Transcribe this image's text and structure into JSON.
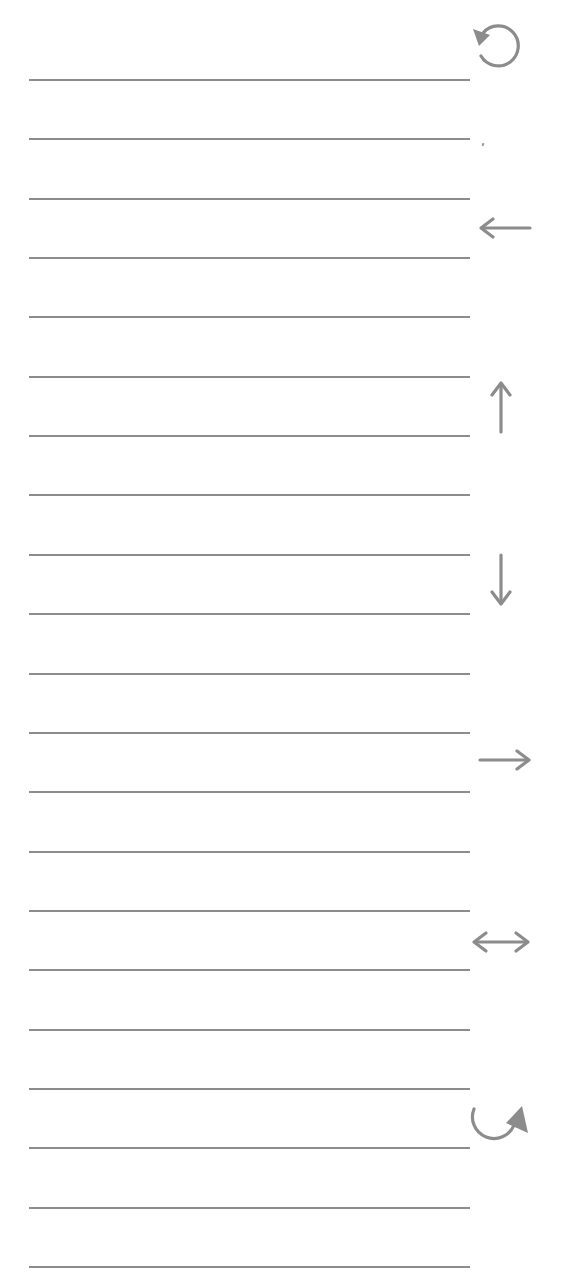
{
  "sheet": {
    "background": "#ffffff",
    "line_color": "#8c8c8c",
    "icon_color": "#8c8c8c",
    "line_count": 21,
    "line_left": 29,
    "line_right": 470,
    "line_first_y": 79,
    "line_spacing": 59.35
  },
  "icons": [
    {
      "name": "rotate-counterclockwise-icon",
      "symbol": "↺",
      "x": 470,
      "y": 22,
      "w": 56,
      "h": 52
    },
    {
      "name": "arrow-left-icon",
      "symbol": "←",
      "x": 478,
      "y": 216,
      "w": 54,
      "h": 24
    },
    {
      "name": "arrow-up-icon",
      "symbol": "↑",
      "x": 488,
      "y": 380,
      "w": 26,
      "h": 54
    },
    {
      "name": "arrow-down-icon",
      "symbol": "↓",
      "x": 488,
      "y": 553,
      "w": 26,
      "h": 54
    },
    {
      "name": "arrow-right-icon",
      "symbol": "→",
      "x": 478,
      "y": 748,
      "w": 54,
      "h": 24
    },
    {
      "name": "arrow-left-right-icon",
      "symbol": "↔",
      "x": 470,
      "y": 929,
      "w": 62,
      "h": 26
    },
    {
      "name": "rotate-clockwise-icon",
      "symbol": "↻",
      "x": 468,
      "y": 1103,
      "w": 62,
      "h": 44
    }
  ]
}
